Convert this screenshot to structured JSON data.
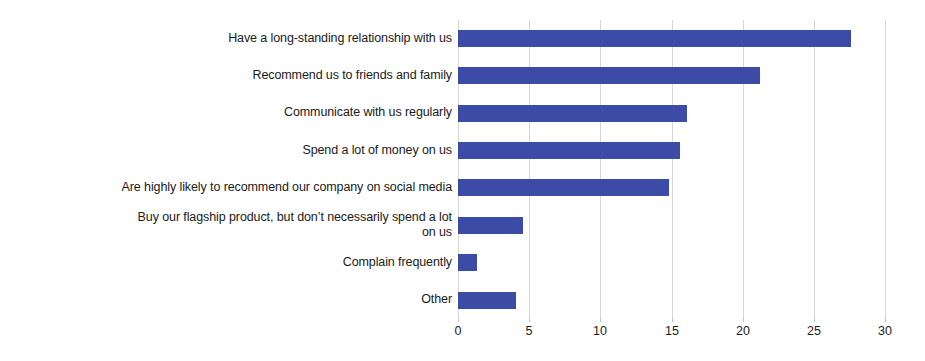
{
  "chart_data": {
    "type": "bar",
    "orientation": "horizontal",
    "title": "",
    "subtitle": "",
    "xlabel": "",
    "ylabel": "",
    "xlim": [
      0,
      30
    ],
    "xticks": [
      0,
      5,
      10,
      15,
      20,
      25,
      30
    ],
    "xtick_labels": [
      "0",
      "5",
      "10",
      "15",
      "20",
      "25",
      "30"
    ],
    "grid": "vertical",
    "legend": "none",
    "bar_color": "#3c4ba5",
    "gridline_color": "#d6d6d6",
    "background_color": "#ffffff",
    "categories": [
      "Have a long-standing relationship with us",
      "Recommend us to friends and family",
      "Communicate with us regularly",
      "Spend a lot of money on us",
      "Are highly likely to recommend our company on social media",
      "Buy our flagship product, but don’t necessarily spend a lot\non us",
      "Complain frequently",
      "Other"
    ],
    "values": [
      27.6,
      21.2,
      16.1,
      15.6,
      14.8,
      4.6,
      1.3,
      4.1
    ]
  }
}
